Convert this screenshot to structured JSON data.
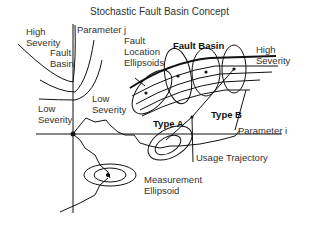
{
  "title": "Stochastic Fault Basin Concept",
  "labels": {
    "parameter_j": "Parameter j",
    "parameter_i": "Parameter i",
    "high_severity_left": "High\nSeverity",
    "fault_basin_left": "Fault\nBasin",
    "low_severity_left": "Low\nSeverity",
    "low_severity_mid": "Low\nSeverity",
    "fault_location_ellipsoids": "Fault\nLocation\nEllipsoids",
    "fault_basin_right": "Fault Basin",
    "high_severity_right": "High\nSeverity",
    "type_a": "Type A",
    "type_b": "Type B",
    "usage_trajectory": "Usage Trajectory",
    "measurement_ellipsoid": "Measurement\nEllipsoid"
  },
  "colors": {
    "line": "#111111",
    "text": "#333333",
    "background": "#ffffff"
  }
}
